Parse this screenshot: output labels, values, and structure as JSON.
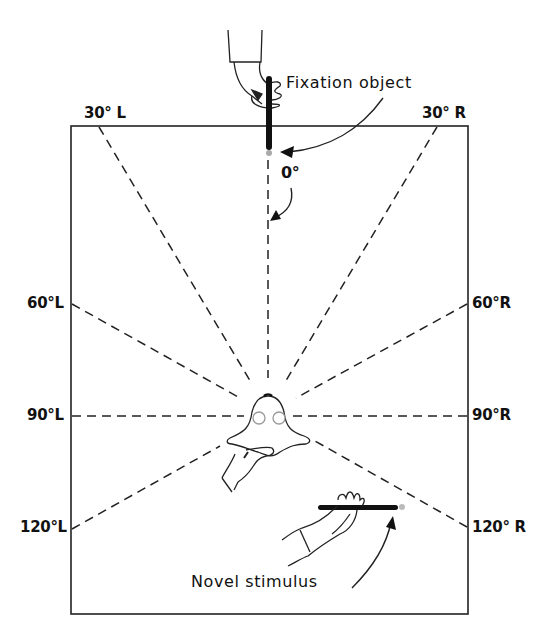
{
  "figure": {
    "type": "infant visual field testing setup (top view)",
    "labels": {
      "fixation_object": "Fixation object",
      "novel_stimulus": "Novel stimulus",
      "zero_degree": "0°"
    },
    "angles": [
      {
        "id": "30L",
        "text": "30° L"
      },
      {
        "id": "30R",
        "text": "30° R"
      },
      {
        "id": "60L",
        "text": "60°L"
      },
      {
        "id": "60R",
        "text": "60°R"
      },
      {
        "id": "90L",
        "text": "90°L"
      },
      {
        "id": "90R",
        "text": "90°R"
      },
      {
        "id": "120L",
        "text": "120°L"
      },
      {
        "id": "120R",
        "text": "120° R"
      }
    ],
    "colors": {
      "ink": "#111111",
      "background": "#ffffff"
    }
  }
}
